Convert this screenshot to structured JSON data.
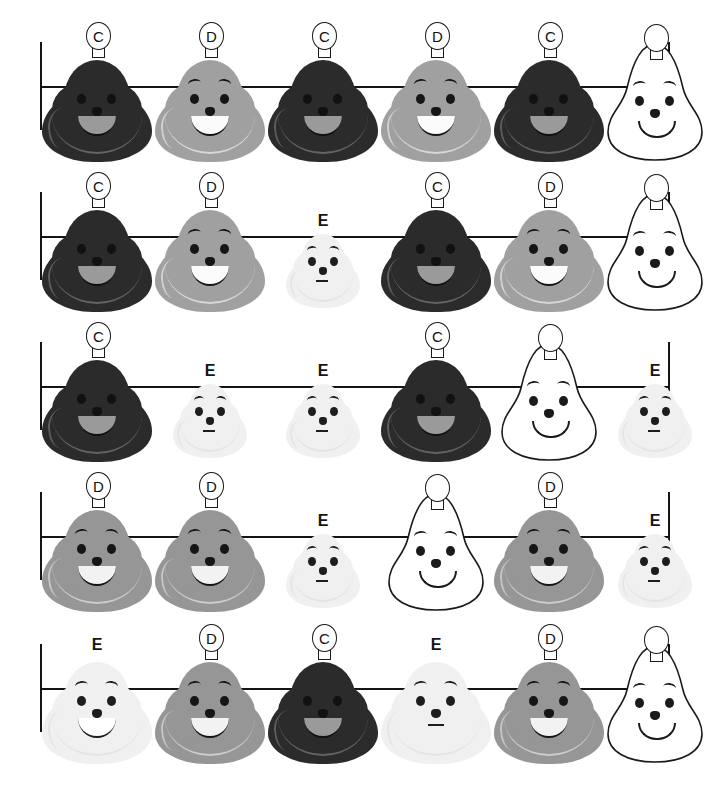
{
  "page": {
    "width": 707,
    "height": 798,
    "background": "#ffffff",
    "row_count": 5,
    "columns_per_row": 6
  },
  "legend": {
    "grades": [
      "C",
      "D",
      "E"
    ],
    "blank_label": "",
    "colors": {
      "grade_c_fill": "#2b2b2b",
      "grade_d_fill": "#a0a0a0",
      "grade_d_dark_fill": "#969696",
      "grade_e_fill": "#f0f0f0",
      "blank_fill": "#ffffff",
      "outline": "#1a1a1a",
      "axis": "#141414",
      "letter": "#111111"
    }
  },
  "rows": [
    {
      "index": 1,
      "items": [
        {
          "letter": "C",
          "grade": "c",
          "badge": true,
          "mouth": "smile",
          "brows": false
        },
        {
          "letter": "D",
          "grade": "d",
          "badge": true,
          "mouth": "smile",
          "brows": true
        },
        {
          "letter": "C",
          "grade": "c",
          "badge": true,
          "mouth": "smile",
          "brows": false
        },
        {
          "letter": "D",
          "grade": "d",
          "badge": true,
          "mouth": "smile",
          "brows": true
        },
        {
          "letter": "C",
          "grade": "c",
          "badge": true,
          "mouth": "smile",
          "brows": false
        },
        {
          "letter": "",
          "grade": "blank",
          "badge": true,
          "mouth": "line",
          "brows": true
        }
      ]
    },
    {
      "index": 2,
      "items": [
        {
          "letter": "C",
          "grade": "c",
          "badge": true,
          "mouth": "smile",
          "brows": false
        },
        {
          "letter": "D",
          "grade": "d",
          "badge": true,
          "mouth": "smile",
          "brows": true
        },
        {
          "letter": "E",
          "grade": "e",
          "badge": false,
          "mouth": "flat",
          "brows": true
        },
        {
          "letter": "C",
          "grade": "c",
          "badge": true,
          "mouth": "smile",
          "brows": false
        },
        {
          "letter": "D",
          "grade": "d",
          "badge": true,
          "mouth": "smile",
          "brows": true
        },
        {
          "letter": "",
          "grade": "blank",
          "badge": true,
          "mouth": "line",
          "brows": true
        }
      ]
    },
    {
      "index": 3,
      "items": [
        {
          "letter": "C",
          "grade": "c",
          "badge": true,
          "mouth": "smile",
          "brows": false
        },
        {
          "letter": "E",
          "grade": "e",
          "badge": false,
          "mouth": "flat",
          "brows": true
        },
        {
          "letter": "E",
          "grade": "e",
          "badge": false,
          "mouth": "flat",
          "brows": true
        },
        {
          "letter": "C",
          "grade": "c",
          "badge": true,
          "mouth": "smile",
          "brows": false
        },
        {
          "letter": "",
          "grade": "blank",
          "badge": true,
          "mouth": "line",
          "brows": true
        },
        {
          "letter": "E",
          "grade": "e",
          "badge": false,
          "mouth": "flat",
          "brows": true
        }
      ]
    },
    {
      "index": 4,
      "items": [
        {
          "letter": "D",
          "grade": "dd",
          "badge": true,
          "mouth": "smile",
          "brows": true
        },
        {
          "letter": "D",
          "grade": "dd",
          "badge": true,
          "mouth": "smile",
          "brows": true
        },
        {
          "letter": "E",
          "grade": "e",
          "badge": false,
          "mouth": "flat",
          "brows": true
        },
        {
          "letter": "",
          "grade": "blank",
          "badge": true,
          "mouth": "line",
          "brows": true
        },
        {
          "letter": "D",
          "grade": "dd",
          "badge": true,
          "mouth": "smile",
          "brows": true
        },
        {
          "letter": "E",
          "grade": "e",
          "badge": false,
          "mouth": "flat",
          "brows": true
        }
      ]
    },
    {
      "index": 5,
      "items": [
        {
          "letter": "E",
          "grade": "e",
          "badge": false,
          "mouth": "smile",
          "brows": true,
          "big": true
        },
        {
          "letter": "D",
          "grade": "dd",
          "badge": true,
          "mouth": "smile",
          "brows": true
        },
        {
          "letter": "C",
          "grade": "c",
          "badge": true,
          "mouth": "smile",
          "brows": false
        },
        {
          "letter": "E",
          "grade": "e",
          "badge": false,
          "mouth": "flat",
          "brows": true,
          "big": true
        },
        {
          "letter": "D",
          "grade": "dd",
          "badge": true,
          "mouth": "smile",
          "brows": true
        },
        {
          "letter": "",
          "grade": "blank",
          "badge": true,
          "mouth": "line",
          "brows": true
        }
      ]
    }
  ]
}
